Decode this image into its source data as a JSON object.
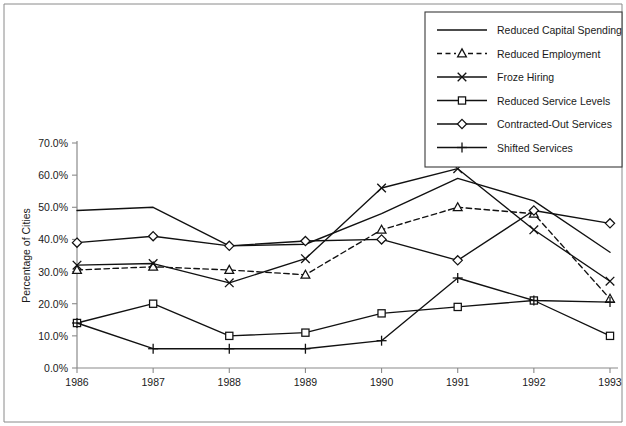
{
  "chart_data": {
    "type": "line",
    "title": "",
    "xlabel": "",
    "ylabel": "Percentage of Cities",
    "categories": [
      "1986",
      "1987",
      "1988",
      "1989",
      "1990",
      "1991",
      "1992",
      "1993"
    ],
    "x": [
      1986,
      1987,
      1988,
      1989,
      1990,
      1991,
      1992,
      1993
    ],
    "ylim": [
      0,
      70
    ],
    "ytick_values": [
      0,
      10,
      20,
      30,
      40,
      50,
      60,
      70
    ],
    "ytick_labels": [
      "0.0%",
      "10.0%",
      "20.0%",
      "30.0%",
      "40.0%",
      "50.0%",
      "60.0%",
      "70.0%"
    ],
    "grid": false,
    "legend_position": "top-right",
    "series": [
      {
        "name": "Reduced Capital Spending",
        "marker": "none",
        "dash": "solid",
        "values": [
          49.0,
          50.0,
          38.0,
          38.5,
          48.0,
          59.0,
          52.0,
          36.0
        ]
      },
      {
        "name": "Reduced Employment",
        "marker": "triangle",
        "dash": "dashed",
        "values": [
          30.5,
          31.5,
          30.5,
          29.0,
          43.0,
          50.0,
          48.0,
          21.5
        ]
      },
      {
        "name": "Froze Hiring",
        "marker": "cross",
        "dash": "solid",
        "values": [
          32.0,
          32.5,
          26.5,
          34.0,
          56.0,
          62.0,
          43.0,
          27.0
        ]
      },
      {
        "name": "Reduced Service Levels",
        "marker": "square",
        "dash": "solid",
        "values": [
          14.0,
          20.0,
          10.0,
          11.0,
          17.0,
          19.0,
          21.0,
          10.0
        ]
      },
      {
        "name": "Contracted-Out Services",
        "marker": "diamond",
        "dash": "solid",
        "values": [
          39.0,
          41.0,
          38.0,
          39.5,
          40.0,
          33.5,
          49.0,
          45.0
        ]
      },
      {
        "name": "Shifted Services",
        "marker": "plus",
        "dash": "solid",
        "values": [
          14.0,
          6.0,
          6.0,
          6.0,
          8.5,
          28.0,
          21.0,
          20.5
        ]
      }
    ]
  },
  "legend": {
    "items": [
      "Reduced Capital Spending",
      "Reduced Employment",
      "Froze Hiring",
      "Reduced Service Levels",
      "Contracted-Out Services",
      "Shifted Services"
    ]
  },
  "colors": {
    "series": "#111111",
    "axis": "#8a8a8a",
    "frame": "#8a8a8a",
    "background": "#ffffff"
  }
}
